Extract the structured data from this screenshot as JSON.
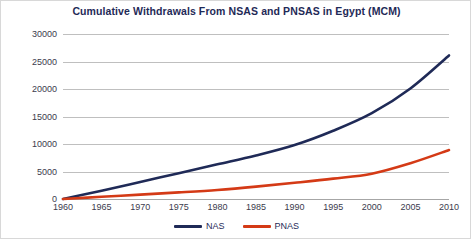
{
  "chart_data": {
    "type": "line",
    "title": "Cumulative Withdrawals From NSAS and PNSAS in Egypt (MCM)",
    "xlabel": "",
    "ylabel": "",
    "xlim": [
      1960,
      2010
    ],
    "ylim": [
      0,
      30000
    ],
    "grid": true,
    "legend_position": "bottom",
    "x": [
      1960,
      1965,
      1970,
      1975,
      1980,
      1985,
      1990,
      1995,
      2000,
      2005,
      2010
    ],
    "xticklabels": [
      "1960",
      "1965",
      "1970",
      "1975",
      "1980",
      "1985",
      "1990",
      "1995",
      "2000",
      "2005",
      "2010"
    ],
    "yticks": [
      0,
      5000,
      10000,
      15000,
      20000,
      25000,
      30000
    ],
    "yticklabels": [
      "0",
      "5000",
      "10000",
      "15000",
      "20000",
      "25000",
      "30000"
    ],
    "series": [
      {
        "name": "NAS",
        "color": "#1f2a57",
        "values": [
          0,
          1500,
          3100,
          4700,
          6300,
          7900,
          9800,
          12400,
          15600,
          20100,
          26100
        ]
      },
      {
        "name": "PNAS",
        "color": "#d43a16",
        "values": [
          0,
          400,
          800,
          1200,
          1650,
          2250,
          2950,
          3700,
          4600,
          6500,
          8900
        ]
      }
    ]
  },
  "legend": {
    "items": [
      {
        "label": "NAS",
        "color": "#1f2a57"
      },
      {
        "label": "PNAS",
        "color": "#d43a16"
      }
    ]
  }
}
